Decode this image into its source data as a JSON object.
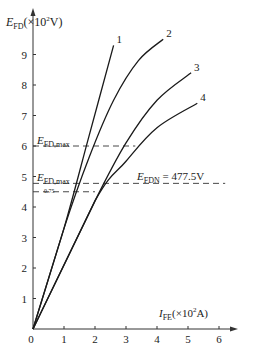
{
  "chart_data": {
    "type": "line",
    "title": "",
    "ylabel": "E_FD(×10²V)",
    "xlabel": "I_FE(×10²A)",
    "xlim": [
      0,
      6.6
    ],
    "ylim": [
      0,
      10
    ],
    "x_ticks": [
      "0",
      "1",
      "2",
      "3",
      "4",
      "5",
      "6"
    ],
    "y_ticks": [
      "1",
      "2",
      "3",
      "4",
      "5",
      "6",
      "7",
      "8",
      "9"
    ],
    "grid": false,
    "series": [
      {
        "name": "1",
        "points": [
          [
            0,
            0
          ],
          [
            1.0,
            3.3
          ],
          [
            1.8,
            6.3
          ],
          [
            2.6,
            9.3
          ]
        ]
      },
      {
        "name": "2",
        "points": [
          [
            0,
            0
          ],
          [
            1.0,
            3.3
          ],
          [
            1.8,
            5.6
          ],
          [
            2.6,
            7.5
          ],
          [
            3.4,
            8.8
          ],
          [
            4.2,
            9.5
          ]
        ]
      },
      {
        "name": "3",
        "points": [
          [
            0,
            0
          ],
          [
            2.0,
            4.2
          ],
          [
            3.0,
            6.1
          ],
          [
            4.0,
            7.5
          ],
          [
            5.1,
            8.4
          ]
        ]
      },
      {
        "name": "4",
        "points": [
          [
            0,
            0
          ],
          [
            2.0,
            4.2
          ],
          [
            3.0,
            5.5
          ],
          [
            4.0,
            6.6
          ],
          [
            5.3,
            7.4
          ]
        ]
      }
    ],
    "reference_lines": [
      {
        "label": "E_FD,max",
        "y": 6.0,
        "x_end": 3.3
      },
      {
        "label": "E_FDN = 477.5V",
        "y": 4.775,
        "x_end": 6.2
      },
      {
        "label": "E_FD,max 0.75",
        "y": 4.5,
        "x_end": 2.0
      }
    ],
    "annotations": {
      "efd_max_top": {
        "main": "E",
        "sub": "FD,max"
      },
      "efd_max_low": {
        "main": "E",
        "sub": "FD,max"
      },
      "factor": "0.75",
      "efdn": {
        "main": "E",
        "sub": "FDN",
        "rest": " = 477.5V"
      }
    }
  },
  "labels": {
    "y_main": "E",
    "y_sub": "FD",
    "y_unit_pre": "(×10",
    "y_unit_sup": "2",
    "y_unit_post": "V)",
    "x_main": "I",
    "x_sub": "FE",
    "x_unit_pre": "(×10",
    "x_unit_sup": "2",
    "x_unit_post": "A)"
  }
}
